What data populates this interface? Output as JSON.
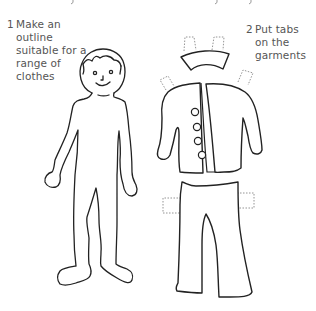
{
  "caption_fragment": "...g  ...y  ...y...",
  "steps": [
    {
      "number": "1",
      "lines": [
        "Make an",
        "outline",
        "suitable for a",
        "range of",
        "clothes"
      ]
    },
    {
      "number": "2",
      "lines": [
        "Put tabs",
        "on the",
        "garments"
      ]
    }
  ],
  "figures": {
    "doll": "body-outline",
    "garments": [
      "collar",
      "jacket",
      "trousers"
    ]
  },
  "colors": {
    "stroke": "#222222",
    "tab_stroke": "#888888",
    "text": "#555555",
    "background": "#ffffff"
  }
}
